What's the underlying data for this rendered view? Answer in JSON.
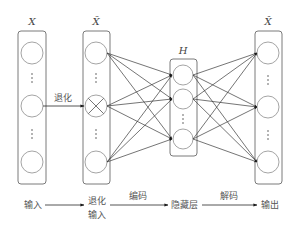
{
  "columns": [
    {
      "id": "X",
      "label": "X"
    },
    {
      "id": "X_tilde",
      "label": "X̃"
    },
    {
      "id": "H",
      "label": "H"
    },
    {
      "id": "X_hat",
      "label": "X̂"
    }
  ],
  "edge_labels": {
    "corruption": "退化"
  },
  "bottom_flow": {
    "input": "输入",
    "corrupted_input_line1": "退化",
    "corrupted_input_line2": "输入",
    "encode": "编码",
    "hidden_layer": "隐藏层",
    "decode": "解码",
    "output": "输出"
  },
  "colors": {
    "box_stroke": "#7a7a7a",
    "node_stroke": "#9a9a9a",
    "edge": "#3a3a3a",
    "text": "#555555"
  }
}
